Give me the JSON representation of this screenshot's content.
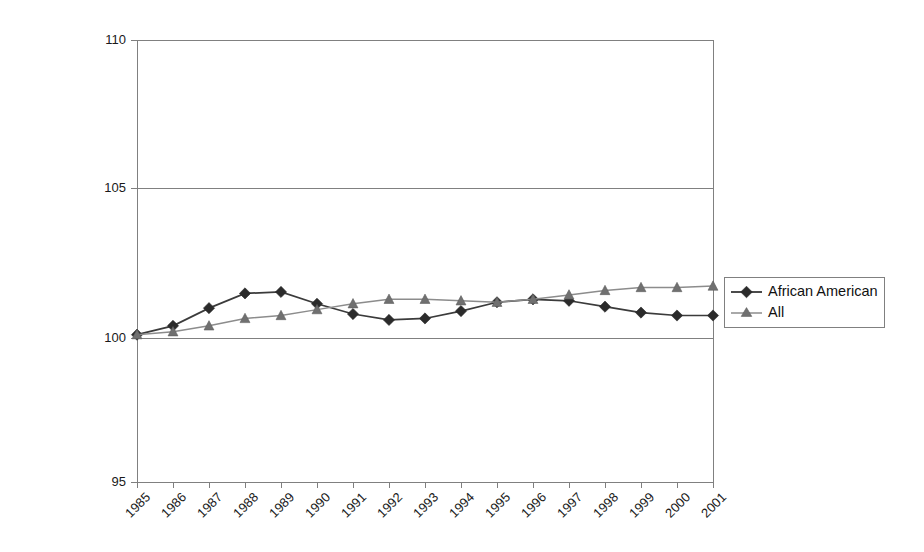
{
  "chart_data": {
    "type": "line",
    "title": "",
    "subtitle": "",
    "xlabel": "",
    "ylabel": "",
    "categories": [
      "1985",
      "1986",
      "1987",
      "1988",
      "1989",
      "1990",
      "1991",
      "1992",
      "1993",
      "1994",
      "1995",
      "1996",
      "1997",
      "1998",
      "1999",
      "2000",
      "2001"
    ],
    "series": [
      {
        "name": "African American",
        "marker": "diamond",
        "color": "#2b2b2b",
        "values": [
          100.0,
          100.3,
          100.9,
          101.4,
          101.45,
          101.05,
          100.7,
          100.5,
          100.55,
          100.8,
          101.1,
          101.2,
          101.15,
          100.95,
          100.75,
          100.65,
          100.65
        ]
      },
      {
        "name": "All",
        "marker": "triangle",
        "color": "#808080",
        "values": [
          100.0,
          100.1,
          100.3,
          100.55,
          100.65,
          100.85,
          101.05,
          101.2,
          101.2,
          101.15,
          101.1,
          101.2,
          101.35,
          101.5,
          101.6,
          101.6,
          101.65
        ]
      }
    ],
    "ylim": [
      95,
      110
    ],
    "yticks": [
      95,
      100,
      105,
      110
    ],
    "ytick_labels": [
      "95",
      "100",
      "105",
      "110"
    ],
    "grid": true,
    "grid_axis": "y",
    "legend_position": "right",
    "legend_entries": [
      "African American",
      "All"
    ],
    "annotations": []
  },
  "legend": {
    "items": [
      {
        "label": "African American",
        "marker": "diamond-marker-icon"
      },
      {
        "label": "All",
        "marker": "triangle-marker-icon"
      }
    ]
  },
  "colors": {
    "series_african_american": "#2b2b2b",
    "series_all": "#808080",
    "grid": "#808080",
    "axis": "#7f7f7f",
    "background": "#ffffff"
  }
}
